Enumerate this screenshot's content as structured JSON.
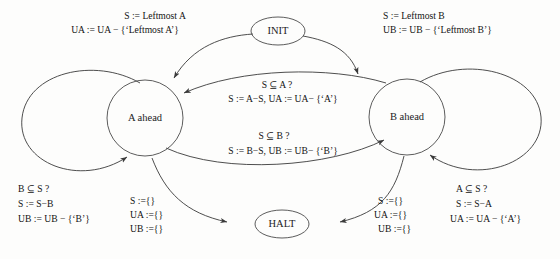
{
  "diagram": {
    "type": "state-machine",
    "background_color": "#fdfdfc",
    "stroke_color": "#4a4a4a",
    "text_color": "#131313",
    "nodes": [
      {
        "id": "init",
        "label": "INIT",
        "shape": "ellipse"
      },
      {
        "id": "a_ahead",
        "label": "A ahead",
        "shape": "circle"
      },
      {
        "id": "b_ahead",
        "label": "B ahead",
        "shape": "circle"
      },
      {
        "id": "halt",
        "label": "HALT",
        "shape": "ellipse"
      }
    ],
    "edges": [
      {
        "id": "init-to-a",
        "from": "INIT",
        "to": "A ahead",
        "lines": [
          "S := Leftmost A",
          "UA := UA − {‘Leftmost A’}"
        ]
      },
      {
        "id": "init-to-b",
        "from": "INIT",
        "to": "B ahead",
        "lines": [
          "S := Leftmost B",
          "UB := UB − {‘Leftmost B’}"
        ]
      },
      {
        "id": "b-to-a",
        "from": "B ahead",
        "to": "A ahead",
        "lines": [
          "S ⊆ A ?",
          "S := A−S,    UA := UA− {‘A’}"
        ]
      },
      {
        "id": "a-to-b",
        "from": "A ahead",
        "to": "B ahead",
        "lines": [
          "S ⊆ B ?",
          "S := B−S,   UB := UB− {‘B’}"
        ]
      },
      {
        "id": "a-self-loop",
        "from": "A ahead",
        "to": "A ahead",
        "lines": [
          "B ⊆ S ?",
          "S := S−B",
          "UB := UB − {‘B’}"
        ]
      },
      {
        "id": "b-self-loop",
        "from": "B ahead",
        "to": "B ahead",
        "lines": [
          "A ⊆ S ?",
          "S := S−A",
          "UA := UA − {‘A’}"
        ]
      },
      {
        "id": "a-to-halt",
        "from": "A ahead",
        "to": "HALT",
        "lines": [
          "S  :={}",
          "UA :={}",
          "UB :={}"
        ]
      },
      {
        "id": "b-to-halt",
        "from": "B ahead",
        "to": "HALT",
        "lines": [
          "S  :={}",
          "UA :={}",
          "UB :={}"
        ]
      }
    ]
  }
}
